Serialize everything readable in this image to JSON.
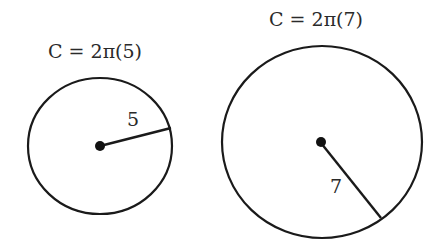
{
  "diagram": {
    "circles": [
      {
        "formula": "C = 2π(5)",
        "radius_label": "5",
        "radius_value": 5
      },
      {
        "formula": "C = 2π(7)",
        "radius_label": "7",
        "radius_value": 7
      }
    ],
    "colors": {
      "stroke": "#1a1a1a",
      "text": "#2a2a2a",
      "background": "#ffffff"
    }
  }
}
